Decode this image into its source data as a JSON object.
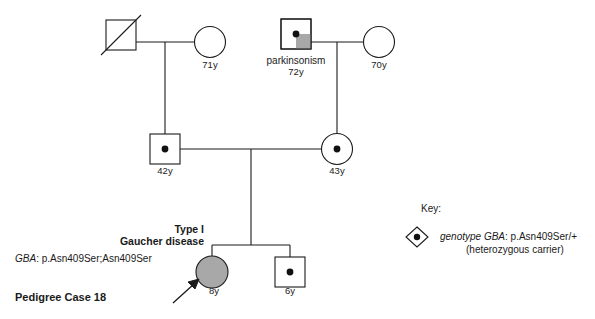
{
  "figure": {
    "caption": "Pedigree Case 18",
    "colors": {
      "stroke": "#1a1a1a",
      "affected_fill": "#a8a8a8",
      "quadrant_fill": "#a8a8a8",
      "background": "#ffffff"
    }
  },
  "individuals": [
    {
      "id": "i-1-1",
      "name": "deceased-grandfather-maternal-left",
      "shape": "square",
      "status": "deceased",
      "generation": 1,
      "age_label": "",
      "condition_label": ""
    },
    {
      "id": "i-1-2",
      "name": "grandmother-left",
      "shape": "circle",
      "status": "unaffected",
      "generation": 1,
      "age_label": "71y",
      "condition_label": ""
    },
    {
      "id": "i-1-3",
      "name": "grandfather-parkinsonism",
      "shape": "square",
      "status": "carrier-quadrant-affected",
      "generation": 1,
      "age_label": "72y",
      "condition_label": "parkinsonism"
    },
    {
      "id": "i-1-4",
      "name": "grandmother-right",
      "shape": "circle",
      "status": "unaffected",
      "generation": 1,
      "age_label": "70y",
      "condition_label": ""
    },
    {
      "id": "i-2-1",
      "name": "father-carrier",
      "shape": "square",
      "status": "carrier",
      "generation": 2,
      "age_label": "42y",
      "condition_label": ""
    },
    {
      "id": "i-2-2",
      "name": "mother-carrier",
      "shape": "circle",
      "status": "carrier",
      "generation": 2,
      "age_label": "43y",
      "condition_label": ""
    },
    {
      "id": "i-3-1",
      "name": "proband-daughter-affected",
      "shape": "circle",
      "status": "affected",
      "generation": 3,
      "age_label": "8y",
      "condition_label": ""
    },
    {
      "id": "i-3-2",
      "name": "son-carrier",
      "shape": "square",
      "status": "carrier",
      "generation": 3,
      "age_label": "6y",
      "condition_label": ""
    }
  ],
  "annotations": {
    "diagnosis_line1": "Type I",
    "diagnosis_line2": "Gaucher disease",
    "genotype_gene": "GBA",
    "genotype_rest": ": p.Asn409Ser;Asn409Ser"
  },
  "key": {
    "title": "Key:",
    "symbol": "diamond-with-dot",
    "line1_italic": "genotype GBA",
    "line1_rest": ": p.Asn409Ser/+",
    "line2": "(heterozygous carrier)"
  }
}
